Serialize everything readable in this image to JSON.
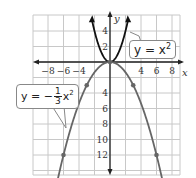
{
  "chart_data": {
    "type": "line",
    "title": "",
    "xlabel": "x",
    "ylabel": "y",
    "xlim": [
      -9.5,
      9.5
    ],
    "ylim": [
      -14.5,
      6
    ],
    "grid": true,
    "x_ticks": [
      "-8",
      "-6",
      "-4",
      "4",
      "6",
      "8"
    ],
    "y_ticks": [
      "4",
      "2",
      "-4",
      "-6",
      "-8",
      "-10",
      "-12"
    ],
    "series": [
      {
        "name": "y = x^2",
        "color": "#111111",
        "points": [
          [
            -2.3,
            5.3
          ],
          [
            -1,
            1
          ],
          [
            0,
            0
          ],
          [
            1,
            1
          ],
          [
            2.3,
            5.3
          ]
        ]
      },
      {
        "name": "y = -1/3 x^2",
        "color": "#666666",
        "points": [
          [
            -6,
            -12
          ],
          [
            -3,
            -3
          ],
          [
            0,
            0
          ],
          [
            3,
            -3
          ],
          [
            6,
            -12
          ]
        ],
        "marked_points": [
          [
            -6,
            -12
          ],
          [
            -3,
            -3
          ],
          [
            3,
            -3
          ],
          [
            6,
            -12
          ]
        ]
      }
    ],
    "annotations": [
      "y = x²",
      "y = −1/3 x²"
    ]
  },
  "labels": {
    "x_axis": "x",
    "y_axis": "y",
    "eq1": {
      "lhs": "y = x",
      "exp": "2"
    },
    "eq2": {
      "lhs": "y = −",
      "num": "1",
      "den": "3",
      "var": "x",
      "exp": "2"
    }
  },
  "colors": {
    "grid": "#c8c8c8",
    "axis": "#222222",
    "curve1": "#111111",
    "curve2": "#666666"
  }
}
